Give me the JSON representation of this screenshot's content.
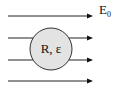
{
  "field": {
    "label": "E",
    "subscript": "0",
    "line_count": 4
  },
  "sphere": {
    "label": "R, ε",
    "fill": "#e3e3e3",
    "stroke": "#333333"
  }
}
